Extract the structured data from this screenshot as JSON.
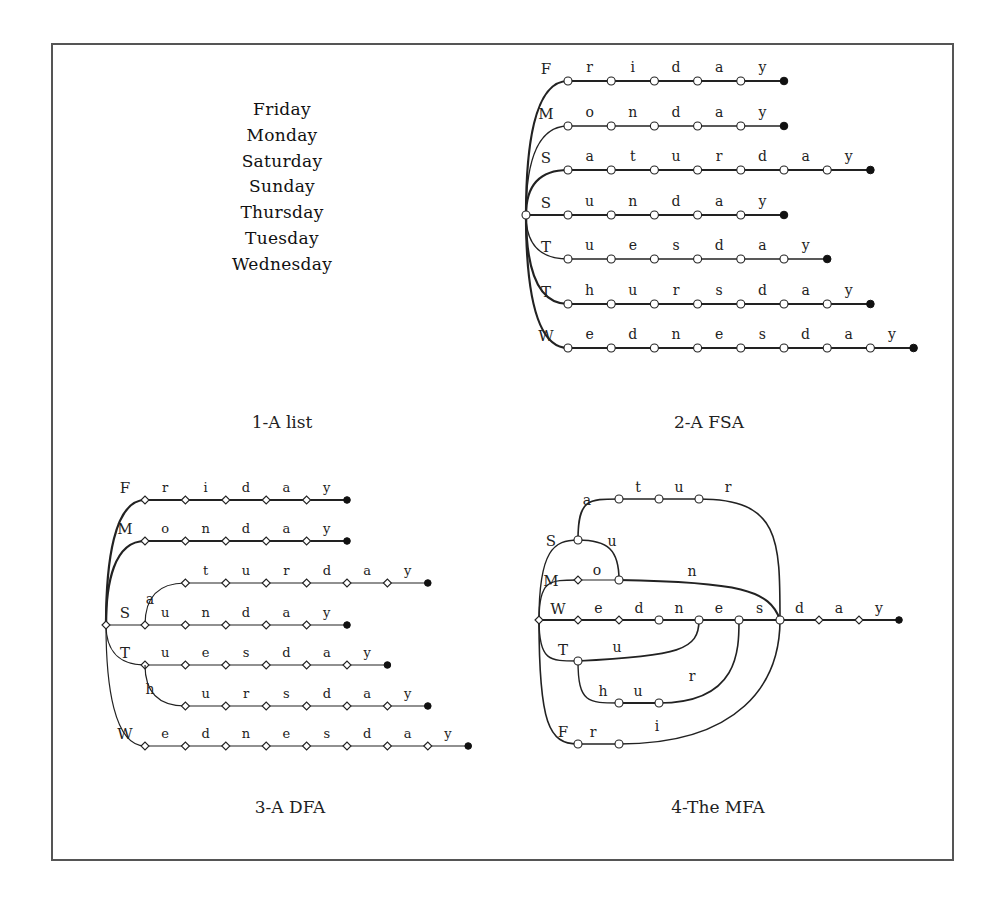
{
  "figure": {
    "panels": [
      {
        "id": "list",
        "caption": "1-A list",
        "words": [
          "Friday",
          "Monday",
          "Saturday",
          "Sunday",
          "Thursday",
          "Tuesday",
          "Wednesday"
        ]
      },
      {
        "id": "fsa",
        "caption": "2-A FSA",
        "start": [
          526,
          215
        ],
        "rows": [
          {
            "word": "Friday",
            "first": "F",
            "y": 81,
            "letters": [
              "r",
              "i",
              "d",
              "a",
              "y"
            ],
            "bold": true
          },
          {
            "word": "Monday",
            "first": "M",
            "y": 126,
            "letters": [
              "o",
              "n",
              "d",
              "a",
              "y"
            ],
            "bold": false
          },
          {
            "word": "Saturday",
            "first": "S",
            "y": 170,
            "letters": [
              "a",
              "t",
              "u",
              "r",
              "d",
              "a",
              "y"
            ],
            "bold": true
          },
          {
            "word": "Sunday",
            "first": "S",
            "y": 215,
            "letters": [
              "u",
              "n",
              "d",
              "a",
              "y"
            ],
            "bold": true
          },
          {
            "word": "Tuesday",
            "first": "T",
            "y": 259,
            "letters": [
              "u",
              "e",
              "s",
              "d",
              "a",
              "y"
            ],
            "bold": false
          },
          {
            "word": "Thursday",
            "first": "T",
            "y": 304,
            "letters": [
              "h",
              "u",
              "r",
              "s",
              "d",
              "a",
              "y"
            ],
            "bold": true
          },
          {
            "word": "Wednesday",
            "first": "W",
            "y": 348,
            "letters": [
              "e",
              "d",
              "n",
              "e",
              "s",
              "d",
              "a",
              "y"
            ],
            "bold": true
          }
        ],
        "x0": 568,
        "dx": 43.2
      },
      {
        "id": "dfa",
        "caption": "3-A DFA",
        "start": [
          106,
          625
        ],
        "x0": 145,
        "dx": 40.4,
        "rows": [
          {
            "first": "F",
            "y": 500,
            "col0": 0,
            "letters": [
              "r",
              "i",
              "d",
              "a",
              "y"
            ],
            "bold": true,
            "from": "start"
          },
          {
            "first": "M",
            "y": 541,
            "col0": 0,
            "letters": [
              "o",
              "n",
              "d",
              "a",
              "y"
            ],
            "bold": true,
            "from": "start"
          },
          {
            "first": "a",
            "y": 583,
            "col0": 1,
            "letters": [
              "t",
              "u",
              "r",
              "d",
              "a",
              "y"
            ],
            "bold": false,
            "from": "S"
          },
          {
            "first": "S",
            "y": 625,
            "col0": 0,
            "letters": [
              "u",
              "n",
              "d",
              "a",
              "y"
            ],
            "bold": false,
            "from": "start"
          },
          {
            "first": "T",
            "y": 665,
            "col0": 0,
            "letters": [
              "u",
              "e",
              "s",
              "d",
              "a",
              "y"
            ],
            "bold": false,
            "from": "start"
          },
          {
            "first": "h",
            "y": 706,
            "col0": 1,
            "letters": [
              "u",
              "r",
              "s",
              "d",
              "a",
              "y"
            ],
            "bold": false,
            "from": "T"
          },
          {
            "first": "W",
            "y": 746,
            "col0": 0,
            "letters": [
              "e",
              "d",
              "n",
              "e",
              "s",
              "d",
              "a",
              "y"
            ],
            "bold": false,
            "from": "start"
          }
        ]
      },
      {
        "id": "mfa",
        "caption": "4-The MFA",
        "labels": {
          "S": "S",
          "M": "M",
          "W": "W",
          "T": "T",
          "F": "F",
          "sat": [
            "a",
            "t",
            "u",
            "r"
          ],
          "sun_u": "u",
          "mon": [
            "o",
            "n"
          ],
          "wed": [
            "e",
            "d",
            "n",
            "e",
            "s"
          ],
          "tail": [
            "d",
            "a",
            "y"
          ],
          "tue_u": "u",
          "thu": [
            "h",
            "u",
            "r"
          ],
          "fri": [
            "r",
            "i"
          ]
        }
      }
    ]
  }
}
